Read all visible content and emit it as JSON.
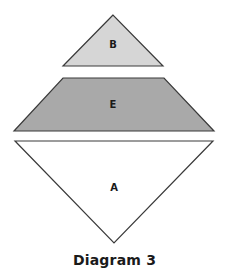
{
  "diagram": {
    "caption": "Diagram 3",
    "colors": {
      "outline": "#3a3a3a",
      "shape_b_fill": "#d6d6d6",
      "shape_e_fill": "#a9a9a9",
      "shape_a_fill": "#ffffff",
      "label": "#1a1a1a"
    },
    "shapes": [
      {
        "id": "B",
        "label": "B",
        "kind": "triangle",
        "orientation": "upright",
        "points": "113,15 63,66 163,66",
        "label_pos": [
          113,
          45
        ]
      },
      {
        "id": "E",
        "label": "E",
        "kind": "trapezoid",
        "orientation": "upright",
        "points": "63,78 164,78 214,131 14,131",
        "label_pos": [
          113,
          108
        ]
      },
      {
        "id": "A",
        "label": "A",
        "kind": "triangle",
        "orientation": "inverted",
        "points": "15,141 213,141 114,243",
        "label_pos": [
          114,
          191
        ]
      }
    ]
  }
}
